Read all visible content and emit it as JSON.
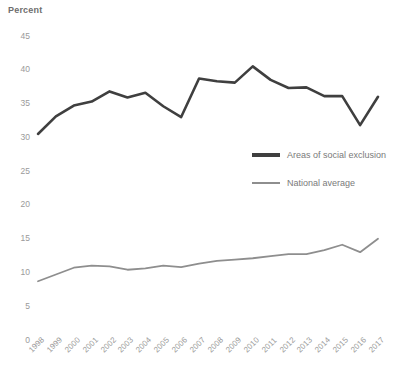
{
  "chart_data": {
    "type": "line",
    "title": "",
    "ylabel": "Percent",
    "xlabel": "",
    "ylim": [
      0,
      45
    ],
    "yticks": [
      0,
      5,
      10,
      15,
      20,
      25,
      30,
      35,
      40,
      45
    ],
    "grid": false,
    "legend_position": "center-right",
    "categories": [
      "1998",
      "1999",
      "2000",
      "2001",
      "2002",
      "2003",
      "2004",
      "2005",
      "2006",
      "2007",
      "2008",
      "2009",
      "2010",
      "2011",
      "2012",
      "2013",
      "2014",
      "2015",
      "2016",
      "2017"
    ],
    "series": [
      {
        "name": "Areas of social exclusion",
        "color": "#3f3f3f",
        "values": [
          30.5,
          33.1,
          34.7,
          35.3,
          36.8,
          35.9,
          36.6,
          34.6,
          33.0,
          38.7,
          38.3,
          38.1,
          40.5,
          38.5,
          37.3,
          37.4,
          36.1,
          36.1,
          31.8,
          36.0
        ]
      },
      {
        "name": "National average",
        "color": "#8e8e8e",
        "values": [
          8.7,
          9.7,
          10.7,
          11.0,
          10.9,
          10.4,
          10.6,
          11.0,
          10.8,
          11.3,
          11.7,
          11.9,
          12.1,
          12.4,
          12.7,
          12.7,
          13.3,
          14.1,
          13.0,
          15.0
        ]
      }
    ]
  },
  "axis": {
    "y_title": "Percent",
    "y_tick_labels": [
      "45",
      "40",
      "35",
      "30",
      "25",
      "20",
      "15",
      "10",
      "5",
      "0"
    ],
    "x_tick_labels": [
      "1998",
      "1999",
      "2000",
      "2001",
      "2002",
      "2003",
      "2004",
      "2005",
      "2006",
      "2007",
      "2008",
      "2009",
      "2010",
      "2011",
      "2012",
      "2013",
      "2014",
      "2015",
      "2016",
      "2017"
    ]
  },
  "legend": {
    "items": [
      {
        "label": "Areas of social exclusion",
        "color": "#3f3f3f",
        "style": "thick"
      },
      {
        "label": "National average",
        "color": "#8e8e8e",
        "style": "thin"
      }
    ]
  }
}
